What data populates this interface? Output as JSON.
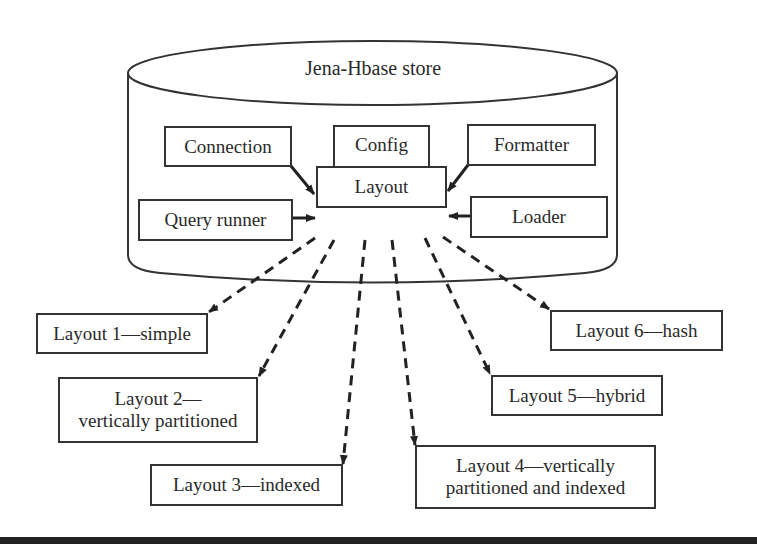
{
  "store": {
    "title": "Jena-Hbase store",
    "components": {
      "connection": "Connection",
      "config": "Config",
      "formatter": "Formatter",
      "layout": "Layout",
      "query_runner": "Query runner",
      "loader": "Loader"
    }
  },
  "layouts": [
    {
      "id": 1,
      "line1": "Layout 1—simple",
      "line2": ""
    },
    {
      "id": 2,
      "line1": "Layout 2—",
      "line2": "vertically partitioned"
    },
    {
      "id": 3,
      "line1": "Layout 3—indexed",
      "line2": ""
    },
    {
      "id": 4,
      "line1": "Layout 4—vertically",
      "line2": "partitioned and indexed"
    },
    {
      "id": 5,
      "line1": "Layout 5—hybrid",
      "line2": ""
    },
    {
      "id": 6,
      "line1": "Layout 6—hash",
      "line2": ""
    }
  ],
  "colors": {
    "stroke": "#333333",
    "text": "#2a2a2a",
    "background": "#ffffff",
    "bottom_rule": "#222222"
  }
}
